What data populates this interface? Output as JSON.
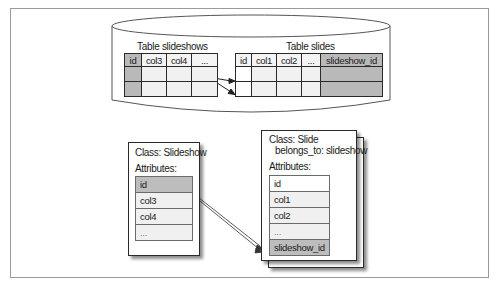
{
  "diagram": {
    "database": {
      "shape": "cylinder",
      "tables": [
        {
          "title": "Table slideshows",
          "columns": [
            "id",
            "col3",
            "col4",
            "..."
          ],
          "key_column": "id",
          "row_count": 2
        },
        {
          "title": "Table slides",
          "columns": [
            "id",
            "col1",
            "col2",
            "...",
            "slideshow_id"
          ],
          "key_column": "slideshow_id",
          "row_count": 2
        }
      ],
      "relation": "slideshows rows → slides rows (one-to-many)"
    },
    "classes": [
      {
        "title": "Class: Slideshow",
        "attributes_label": "Attributes:",
        "attributes": [
          "id",
          "col3",
          "col4",
          "..."
        ],
        "key_attribute": "id"
      },
      {
        "title": "Class: Slide",
        "subtitle": "belongs_to: slideshow",
        "attributes_label": "Attributes:",
        "attributes": [
          "id",
          "col1",
          "col2",
          "...",
          "slideshow_id"
        ],
        "key_attribute": "slideshow_id"
      }
    ],
    "relation": "Slideshow.id → Slide.slideshow_id (one-to-many)"
  },
  "colors": {
    "key_fill": "#b9b9b9",
    "cell_fill": "#f1f1f1",
    "border": "#2a2a2a",
    "frame": "#9a9a9a"
  }
}
